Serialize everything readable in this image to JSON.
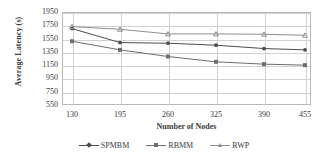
{
  "chart_data": {
    "type": "line",
    "title": "",
    "xlabel": "Number of Nodes",
    "ylabel": "Average Latency (s)",
    "categories": [
      130,
      195,
      260,
      325,
      390,
      455
    ],
    "x": [
      130,
      195,
      260,
      325,
      390,
      455
    ],
    "xtick_labels": [
      "130",
      "195",
      "260",
      "325",
      "390",
      "455"
    ],
    "ytick_labels": [
      "1950",
      "1750",
      "1550",
      "1350",
      "1150",
      "950",
      "750",
      "550"
    ],
    "yticks": [
      1950,
      1750,
      1550,
      1350,
      1150,
      950,
      750,
      550
    ],
    "ylim": [
      550,
      1950
    ],
    "grid": true,
    "legend_position": "bottom",
    "series": [
      {
        "name": "SPMBM",
        "marker": "diamond",
        "color": "#4c4c4c",
        "values": [
          1700,
          1490,
          1480,
          1450,
          1400,
          1380
        ]
      },
      {
        "name": "RBMM",
        "marker": "square",
        "color": "#6e6e6e",
        "values": [
          1510,
          1380,
          1280,
          1200,
          1165,
          1150
        ]
      },
      {
        "name": "RWP",
        "marker": "triangle",
        "color": "#8f8f8f",
        "values": [
          1730,
          1690,
          1620,
          1620,
          1615,
          1600
        ]
      }
    ]
  },
  "axes": {
    "y_title": "Average Latency (s)",
    "x_title": "Number of Nodes"
  },
  "legend": {
    "items": [
      {
        "label": "SPMBM",
        "marker": "diamond"
      },
      {
        "label": "RBMM",
        "marker": "square"
      },
      {
        "label": "RWP",
        "marker": "triangle"
      }
    ]
  }
}
